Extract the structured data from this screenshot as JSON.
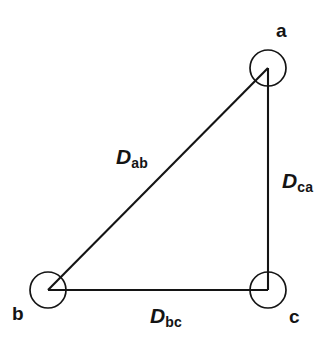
{
  "diagram": {
    "type": "triangle-distance-graph",
    "background_color": "#ffffff",
    "stroke_color": "#141414",
    "text_color": "#141414",
    "nodes": [
      {
        "id": "a",
        "label": "a",
        "cx": 268,
        "cy": 68,
        "r": 18,
        "label_x": 276,
        "label_y": 21
      },
      {
        "id": "b",
        "label": "b",
        "cx": 48,
        "cy": 290,
        "r": 18,
        "label_x": 12,
        "label_y": 304
      },
      {
        "id": "c",
        "label": "c",
        "cx": 268,
        "cy": 290,
        "r": 18,
        "label_x": 289,
        "label_y": 307
      }
    ],
    "edges": [
      {
        "id": "ab",
        "from": "a",
        "to": "b",
        "symbol": "D",
        "subscript": "ab",
        "label_x": 116,
        "label_y": 146,
        "x1": 268,
        "y1": 68,
        "x2": 48,
        "y2": 290
      },
      {
        "id": "ca",
        "from": "c",
        "to": "a",
        "symbol": "D",
        "subscript": "ca",
        "label_x": 282,
        "label_y": 170,
        "x1": 268,
        "y1": 68,
        "x2": 268,
        "y2": 290
      },
      {
        "id": "bc",
        "from": "b",
        "to": "c",
        "symbol": "D",
        "subscript": "bc",
        "label_x": 150,
        "label_y": 305,
        "x1": 48,
        "y1": 290,
        "x2": 268,
        "y2": 290
      }
    ]
  }
}
